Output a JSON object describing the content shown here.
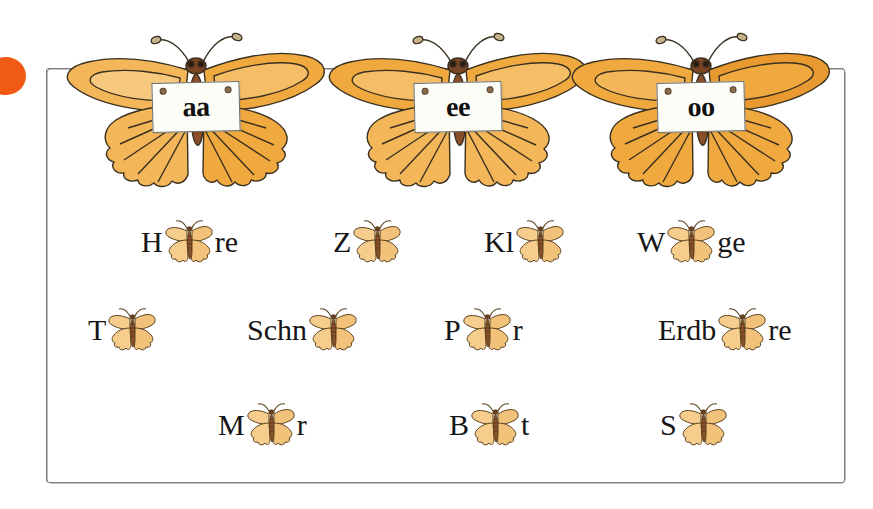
{
  "page": {
    "width": 873,
    "height": 509,
    "background": "#ffffff",
    "bullet_marker_color": "#f05a14",
    "frame_color": "#6f7072"
  },
  "header": {
    "label": "vowel-pair-butterflies",
    "butterflies": [
      {
        "sign_text": "aa",
        "icon": "butterfly-icon"
      },
      {
        "sign_text": "ee",
        "icon": "butterfly-icon"
      },
      {
        "sign_text": "oo",
        "icon": "butterfly-icon"
      }
    ]
  },
  "exercise": {
    "rows": [
      {
        "items": [
          {
            "prefix": "H",
            "icon": "butterfly-icon",
            "suffix": "re"
          },
          {
            "prefix": "Z",
            "icon": "butterfly-icon",
            "suffix": ""
          },
          {
            "prefix": "Kl",
            "icon": "butterfly-icon",
            "suffix": ""
          },
          {
            "prefix": "W",
            "icon": "butterfly-icon",
            "suffix": "ge"
          }
        ]
      },
      {
        "items": [
          {
            "prefix": "T",
            "icon": "butterfly-icon",
            "suffix": ""
          },
          {
            "prefix": "Schn",
            "icon": "butterfly-icon",
            "suffix": ""
          },
          {
            "prefix": "P",
            "icon": "butterfly-icon",
            "suffix": "r"
          },
          {
            "prefix": "Erdb",
            "icon": "butterfly-icon",
            "suffix": "re"
          }
        ]
      },
      {
        "items": [
          {
            "prefix": "M",
            "icon": "butterfly-icon",
            "suffix": "r"
          },
          {
            "prefix": "B",
            "icon": "butterfly-icon",
            "suffix": "t"
          },
          {
            "prefix": "S",
            "icon": "butterfly-icon",
            "suffix": ""
          }
        ]
      }
    ]
  },
  "colors": {
    "wing_light": "#f7c97e",
    "wing_mid": "#f0a93f",
    "wing_dark": "#e08b22",
    "body_brown": "#7a4524",
    "outline": "#3a3020",
    "mini_wing": "#f6cd8d"
  }
}
